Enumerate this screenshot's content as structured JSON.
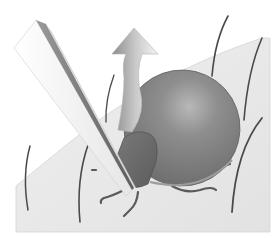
{
  "illustration": {
    "subject": "tick-removal-with-tweezers",
    "elements": [
      "skin-surface",
      "hairs",
      "tick-body",
      "tick-head",
      "tick-legs",
      "tweezers",
      "pull-up-arrow"
    ]
  },
  "colors": {
    "background": "#ffffff",
    "skin": "#e9e9e9",
    "skin_edge": "#d6d6d6",
    "hair": "#4a4a4a",
    "tick_body": "#8a8a8a",
    "tick_body_highlight": "#b4b4b4",
    "tick_head": "#6c6c6c",
    "tick_leg": "#5a5a5a",
    "tweezer_light": "#f0f0f0",
    "tweezer_dark": "#7a7a7a",
    "arrow_light": "#f2f2f2",
    "arrow_dark": "#8c8c8c"
  }
}
